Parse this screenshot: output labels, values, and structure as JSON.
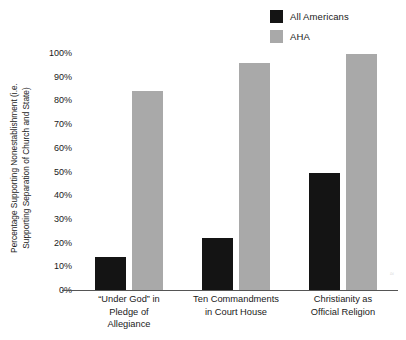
{
  "chart_data": {
    "type": "bar",
    "title": "",
    "subtitle": "",
    "xlabel": "",
    "ylabel": "Percentage Supporting Nonestablishment (i.e. Supporting Separation of Church and State)",
    "ylabel_lines": [
      "Percentage Supporting Nonestablishment (i.e.",
      "Supporting Separation of Church and State)"
    ],
    "categories": [
      "“Under God” in Pledge of Allegiance",
      "Ten Commandments in Court House",
      "Christianity as Official Religion"
    ],
    "category_label_lines": [
      [
        "“Under God” in",
        "Pledge of",
        "Allegiance"
      ],
      [
        "Ten Commandments",
        "in Court House"
      ],
      [
        "Christianity as",
        "Official Religion"
      ]
    ],
    "series": [
      {
        "name": "All Americans",
        "color": "#141414",
        "values": [
          14,
          22,
          49.5
        ]
      },
      {
        "name": "AHA",
        "color": "#a9a9a9",
        "values": [
          84,
          96,
          99.5
        ]
      }
    ],
    "ylim": [
      0,
      100
    ],
    "yticks": [
      0,
      10,
      20,
      30,
      40,
      50,
      60,
      70,
      80,
      90,
      100
    ],
    "ytick_labels": [
      "0%",
      "10%",
      "20%",
      "30%",
      "40%",
      "50%",
      "60%",
      "70%",
      "80%",
      "90%",
      "100%"
    ],
    "grid": false,
    "legend_position": "top-right",
    "value_suffix": "%"
  },
  "legend": {
    "entries": [
      {
        "label": "All Americans",
        "color": "#141414",
        "swatch": "legend-swatch-black"
      },
      {
        "label": "AHA",
        "color": "#a9a9a9",
        "swatch": "legend-swatch-gray"
      }
    ]
  },
  "artifacts": {
    "mark_right": "≈"
  }
}
